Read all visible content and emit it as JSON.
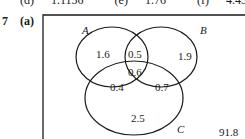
{
  "previous_answers": [
    {
      "label": "(d)",
      "value": "1.1136"
    },
    {
      "label": "(e)",
      "value": "1.76"
    },
    {
      "label": "(f)",
      "value": "4.4344"
    }
  ],
  "question": {
    "number": "7",
    "part": "(a)"
  },
  "venn": {
    "sets": {
      "A": "A",
      "B": "B",
      "C": "C"
    },
    "regions": {
      "A_only": "1.6",
      "B_only": "1.9",
      "C_only": "2.5",
      "A_and_B_only": "0.5",
      "A_and_C_only": "0.4",
      "B_and_C_only": "0.7",
      "A_B_C": "0.6",
      "outside": "91.8"
    }
  }
}
